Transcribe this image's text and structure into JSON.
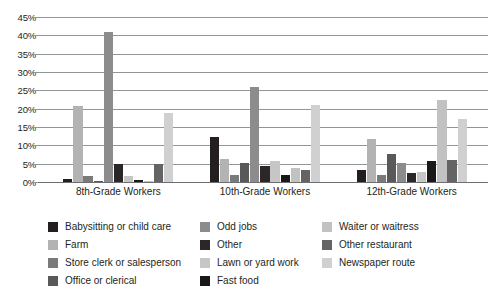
{
  "chart_data": {
    "type": "bar",
    "title": "",
    "subtitle": "",
    "xlabel": "",
    "ylabel": "",
    "ylim": [
      0,
      45
    ],
    "ytick_labels": [
      "0%",
      "5%",
      "10%",
      "15%",
      "20%",
      "25%",
      "30%",
      "35%",
      "40%",
      "45%"
    ],
    "ytick_values": [
      0,
      5,
      10,
      15,
      20,
      25,
      30,
      35,
      40,
      45
    ],
    "grid": "horizontal",
    "legend_position": "bottom",
    "categories": [
      "8th-Grade Workers",
      "10th-Grade Workers",
      "12th-Grade Workers"
    ],
    "series": [
      {
        "name": "Babysitting or child care",
        "color": "#231f20",
        "values": [
          0.8,
          12.4,
          3.3
        ]
      },
      {
        "name": "Farm",
        "color": "#b3b3b3",
        "values": [
          20.8,
          6.4,
          11.7
        ]
      },
      {
        "name": "Store clerk or salesperson",
        "color": "#7a7a7a",
        "values": [
          1.7,
          2.0,
          1.8
        ]
      },
      {
        "name": "Office or clerical",
        "color": "#595959",
        "values": [
          0.3,
          5.2,
          7.7
        ]
      },
      {
        "name": "Odd jobs",
        "color": "#8c8c8c",
        "values": [
          41.0,
          26.0,
          5.2
        ]
      },
      {
        "name": "Other",
        "color": "#2b2728",
        "values": [
          4.8,
          4.5,
          2.5
        ]
      },
      {
        "name": "Lawn or yard work",
        "color": "#c6c6c6",
        "values": [
          1.7,
          5.8,
          2.6
        ]
      },
      {
        "name": "Fast food",
        "color": "#1a1718",
        "values": [
          0.5,
          2.0,
          5.6
        ]
      },
      {
        "name": "Waiter or waitress",
        "color": "#c2c2c2",
        "values": [
          0.3,
          3.8,
          22.3
        ]
      },
      {
        "name": "Other restaurant",
        "color": "#646464",
        "values": [
          4.8,
          3.2,
          5.9
        ]
      },
      {
        "name": "Newspaper route",
        "color": "#d0d0d0",
        "values": [
          18.7,
          20.9,
          17.1
        ]
      }
    ]
  },
  "legend": {
    "columns": [
      [
        "Babysitting or child care",
        "Farm",
        "Store clerk or salesperson",
        "Office or clerical"
      ],
      [
        "Odd jobs",
        "Other",
        "Lawn or yard work",
        "Fast food"
      ],
      [
        "Waiter or waitress",
        "Other restaurant",
        "Newspaper route"
      ]
    ]
  },
  "colors": {
    "gridline": "#929497",
    "axis_text": "#231f20",
    "background": "#ffffff"
  }
}
